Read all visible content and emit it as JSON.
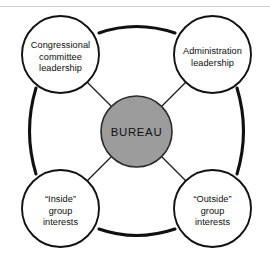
{
  "figure": {
    "center": {
      "label": "BUREAU",
      "fill_color": "#9c9c9c",
      "stroke_color": "#2a2a2a"
    },
    "nodes": [
      {
        "id": "congressional-committee-leadership",
        "position": "top-left",
        "lines": [
          "Congressional",
          "committee",
          "leadership"
        ]
      },
      {
        "id": "administration-leadership",
        "position": "top-right",
        "lines": [
          "Administration",
          "leadership"
        ]
      },
      {
        "id": "inside-group-interests",
        "position": "bottom-left",
        "lines": [
          "“Inside”",
          "group",
          "interests"
        ]
      },
      {
        "id": "outside-group-interests",
        "position": "bottom-right",
        "lines": [
          "“Outside”",
          "group",
          "interests"
        ]
      }
    ],
    "colors": {
      "background": "#ffffff",
      "outline": "#121212",
      "center_fill": "#9c9c9c",
      "spoke": "#1a1a1a",
      "scan_line": "#cfcfcf"
    }
  }
}
